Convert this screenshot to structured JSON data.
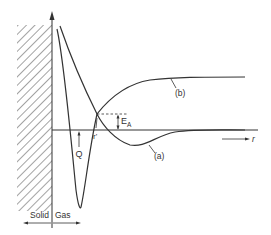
{
  "diagram": {
    "type": "potential-energy-diagram",
    "colors": {
      "ink": "#333333",
      "hatch": "#555555",
      "background": "#ffffff"
    },
    "labels": {
      "curve_b": "(b)",
      "curve_a": "(a)",
      "activation_energy_main": "E",
      "activation_energy_sub": "A",
      "crossing_distance": "r'",
      "heat_of_adsorption": "Q",
      "distance_axis": "r",
      "solid_region": "Solid",
      "gas_region": "Gas"
    },
    "regions": [
      {
        "name": "solid",
        "label": "Solid",
        "style": "hatched"
      },
      {
        "name": "gas",
        "label": "Gas",
        "style": "open"
      }
    ],
    "curves": [
      {
        "id": "a",
        "label": "(a)",
        "description": "deep potential well with minimum of depth Q near surface, shallow minimum further out, approaching zero"
      },
      {
        "id": "b",
        "label": "(b)",
        "description": "repulsive near surface, crossing curve (a) at r', rising to positive plateau"
      }
    ],
    "annotations": [
      {
        "id": "E_A",
        "text": "EA",
        "meaning": "activation energy at crossing point above zero line"
      },
      {
        "id": "r_prime",
        "text": "r'",
        "meaning": "distance of curve crossing"
      },
      {
        "id": "Q",
        "text": "Q",
        "meaning": "depth of potential well"
      }
    ]
  }
}
